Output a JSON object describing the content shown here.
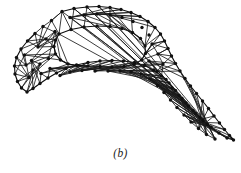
{
  "figure": {
    "caption": "(b)",
    "kind": "finite-element-mesh",
    "node_color": "#111111",
    "edge_color": "#1a1a1a",
    "background_color": "#ffffff",
    "node_radius": 1.7,
    "viewbox": "0 0 241 173"
  },
  "chart_data": {
    "type": "diagram",
    "subtitle": "(b)",
    "xlabel": "",
    "ylabel": "",
    "node_count": 96,
    "edge_count": 243,
    "outer_boundary_node_count": 58,
    "hole_boundary_node_count": 24,
    "nodes": [
      [
        62.0,
        11.5
      ],
      [
        74.0,
        8.5
      ],
      [
        87.0,
        7.0
      ],
      [
        99.0,
        6.5
      ],
      [
        110.0,
        7.5
      ],
      [
        121.0,
        9.5
      ],
      [
        131.0,
        12.5
      ],
      [
        140.0,
        16.5
      ],
      [
        148.0,
        21.5
      ],
      [
        155.0,
        27.5
      ],
      [
        160.5,
        34.0
      ],
      [
        164.5,
        41.0
      ],
      [
        168.0,
        48.5
      ],
      [
        171.5,
        56.0
      ],
      [
        175.5,
        63.5
      ],
      [
        180.0,
        71.0
      ],
      [
        185.0,
        78.5
      ],
      [
        190.5,
        86.0
      ],
      [
        196.5,
        93.5
      ],
      [
        202.5,
        101.0
      ],
      [
        208.5,
        108.5
      ],
      [
        214.0,
        116.0
      ],
      [
        219.5,
        123.0
      ],
      [
        224.5,
        129.5
      ],
      [
        229.5,
        135.5
      ],
      [
        233.5,
        140.0
      ],
      [
        227.0,
        138.0
      ],
      [
        219.0,
        133.0
      ],
      [
        211.0,
        127.0
      ],
      [
        203.0,
        120.5
      ],
      [
        195.5,
        113.5
      ],
      [
        188.5,
        106.0
      ],
      [
        182.0,
        98.5
      ],
      [
        175.5,
        90.5
      ],
      [
        169.0,
        83.0
      ],
      [
        161.5,
        76.0
      ],
      [
        153.5,
        70.0
      ],
      [
        144.5,
        65.5
      ],
      [
        134.5,
        62.5
      ],
      [
        123.5,
        61.0
      ],
      [
        112.0,
        60.5
      ],
      [
        100.0,
        61.0
      ],
      [
        88.0,
        62.5
      ],
      [
        76.5,
        65.0
      ],
      [
        66.0,
        68.5
      ],
      [
        56.5,
        73.0
      ],
      [
        48.0,
        78.0
      ],
      [
        40.0,
        83.5
      ],
      [
        33.0,
        88.5
      ],
      [
        27.0,
        92.0
      ],
      [
        21.5,
        88.0
      ],
      [
        17.5,
        81.5
      ],
      [
        15.0,
        74.0
      ],
      [
        14.5,
        66.0
      ],
      [
        16.5,
        57.5
      ],
      [
        21.0,
        49.0
      ],
      [
        27.5,
        41.0
      ],
      [
        35.0,
        33.5
      ],
      [
        43.0,
        26.5
      ],
      [
        51.5,
        20.5
      ],
      [
        59.0,
        34.0
      ],
      [
        71.0,
        29.5
      ],
      [
        84.0,
        27.0
      ],
      [
        97.0,
        26.0
      ],
      [
        110.0,
        26.5
      ],
      [
        122.0,
        28.5
      ],
      [
        132.5,
        32.5
      ],
      [
        140.5,
        38.5
      ],
      [
        145.0,
        46.0
      ],
      [
        145.5,
        53.5
      ],
      [
        141.5,
        60.0
      ],
      [
        134.0,
        64.5
      ],
      [
        124.0,
        66.5
      ],
      [
        112.0,
        67.0
      ],
      [
        100.0,
        66.5
      ],
      [
        88.0,
        66.0
      ],
      [
        77.0,
        65.5
      ],
      [
        68.0,
        64.0
      ],
      [
        60.5,
        60.0
      ],
      [
        55.5,
        54.0
      ],
      [
        54.0,
        46.5
      ],
      [
        55.5,
        40.0
      ],
      [
        38.0,
        47.0
      ],
      [
        46.0,
        39.0
      ],
      [
        55.0,
        31.5
      ],
      [
        48.5,
        58.5
      ],
      [
        40.0,
        64.0
      ],
      [
        33.0,
        70.0
      ],
      [
        29.0,
        77.5
      ],
      [
        26.0,
        65.0
      ],
      [
        24.5,
        55.0
      ],
      [
        31.5,
        60.5
      ],
      [
        41.0,
        73.5
      ],
      [
        50.0,
        68.5
      ],
      [
        60.0,
        75.5
      ],
      [
        70.0,
        72.0
      ],
      [
        82.0,
        70.5
      ],
      [
        95.0,
        71.0
      ],
      [
        108.0,
        71.0
      ],
      [
        120.0,
        71.0
      ],
      [
        131.0,
        71.5
      ],
      [
        141.0,
        74.0
      ],
      [
        150.0,
        79.0
      ],
      [
        157.5,
        85.5
      ],
      [
        164.0,
        92.5
      ],
      [
        170.5,
        100.0
      ],
      [
        177.0,
        107.5
      ],
      [
        184.0,
        115.0
      ],
      [
        191.0,
        122.0
      ],
      [
        198.5,
        128.5
      ],
      [
        206.5,
        134.5
      ],
      [
        215.0,
        139.0
      ],
      [
        152.0,
        44.0
      ],
      [
        158.0,
        54.0
      ],
      [
        163.0,
        64.0
      ],
      [
        157.0,
        71.5
      ],
      [
        149.0,
        61.0
      ],
      [
        166.0,
        79.5
      ],
      [
        172.0,
        88.0
      ],
      [
        179.0,
        95.5
      ],
      [
        186.0,
        103.0
      ],
      [
        193.0,
        110.5
      ],
      [
        200.0,
        117.5
      ],
      [
        207.5,
        124.5
      ],
      [
        70.0,
        17.5
      ],
      [
        84.0,
        15.0
      ],
      [
        97.0,
        14.0
      ],
      [
        110.0,
        15.0
      ],
      [
        122.0,
        17.5
      ],
      [
        133.0,
        21.5
      ],
      [
        142.0,
        27.5
      ],
      [
        149.0,
        35.0
      ]
    ],
    "edges": [
      [
        0,
        1
      ],
      [
        1,
        2
      ],
      [
        2,
        3
      ],
      [
        3,
        4
      ],
      [
        4,
        5
      ],
      [
        5,
        6
      ],
      [
        6,
        7
      ],
      [
        7,
        8
      ],
      [
        8,
        9
      ],
      [
        9,
        10
      ],
      [
        10,
        11
      ],
      [
        11,
        12
      ],
      [
        12,
        13
      ],
      [
        13,
        14
      ],
      [
        14,
        15
      ],
      [
        15,
        16
      ],
      [
        16,
        17
      ],
      [
        17,
        18
      ],
      [
        18,
        19
      ],
      [
        19,
        20
      ],
      [
        20,
        21
      ],
      [
        21,
        22
      ],
      [
        22,
        23
      ],
      [
        23,
        24
      ],
      [
        24,
        25
      ],
      [
        25,
        26
      ],
      [
        26,
        27
      ],
      [
        27,
        28
      ],
      [
        28,
        29
      ],
      [
        29,
        30
      ],
      [
        30,
        31
      ],
      [
        31,
        32
      ],
      [
        32,
        33
      ],
      [
        33,
        34
      ],
      [
        34,
        35
      ],
      [
        35,
        36
      ],
      [
        36,
        37
      ],
      [
        37,
        38
      ],
      [
        38,
        39
      ],
      [
        39,
        40
      ],
      [
        40,
        41
      ],
      [
        41,
        42
      ],
      [
        42,
        43
      ],
      [
        43,
        44
      ],
      [
        44,
        45
      ],
      [
        45,
        46
      ],
      [
        46,
        47
      ],
      [
        47,
        48
      ],
      [
        48,
        49
      ],
      [
        49,
        50
      ],
      [
        50,
        51
      ],
      [
        51,
        52
      ],
      [
        52,
        53
      ],
      [
        53,
        54
      ],
      [
        54,
        55
      ],
      [
        55,
        56
      ],
      [
        56,
        57
      ],
      [
        57,
        58
      ],
      [
        58,
        59
      ],
      [
        59,
        0
      ],
      [
        60,
        61
      ],
      [
        61,
        62
      ],
      [
        62,
        63
      ],
      [
        63,
        64
      ],
      [
        64,
        65
      ],
      [
        65,
        66
      ],
      [
        66,
        67
      ],
      [
        67,
        68
      ],
      [
        68,
        69
      ],
      [
        69,
        70
      ],
      [
        70,
        71
      ],
      [
        71,
        72
      ],
      [
        72,
        73
      ],
      [
        73,
        74
      ],
      [
        74,
        75
      ],
      [
        75,
        76
      ],
      [
        76,
        77
      ],
      [
        77,
        78
      ],
      [
        78,
        79
      ],
      [
        79,
        80
      ],
      [
        80,
        81
      ],
      [
        81,
        60
      ],
      [
        120,
        121
      ],
      [
        121,
        122
      ],
      [
        122,
        123
      ],
      [
        123,
        124
      ],
      [
        124,
        125
      ],
      [
        125,
        126
      ],
      [
        126,
        127
      ],
      [
        0,
        120
      ],
      [
        1,
        120
      ],
      [
        1,
        121
      ],
      [
        2,
        121
      ],
      [
        2,
        122
      ],
      [
        3,
        122
      ],
      [
        3,
        123
      ],
      [
        4,
        123
      ],
      [
        4,
        124
      ],
      [
        5,
        124
      ],
      [
        5,
        125
      ],
      [
        6,
        125
      ],
      [
        6,
        126
      ],
      [
        7,
        126
      ],
      [
        7,
        127
      ],
      [
        8,
        127
      ],
      [
        9,
        127
      ],
      [
        120,
        61
      ],
      [
        120,
        60
      ],
      [
        121,
        62
      ],
      [
        122,
        63
      ],
      [
        123,
        63
      ],
      [
        123,
        64
      ],
      [
        124,
        64
      ],
      [
        125,
        65
      ],
      [
        126,
        66
      ],
      [
        127,
        67
      ],
      [
        127,
        68
      ],
      [
        9,
        68
      ],
      [
        10,
        68
      ],
      [
        10,
        69
      ],
      [
        11,
        69
      ],
      [
        11,
        112
      ],
      [
        112,
        69
      ],
      [
        112,
        70
      ],
      [
        112,
        11
      ],
      [
        112,
        113
      ],
      [
        113,
        70
      ],
      [
        113,
        12
      ],
      [
        113,
        12
      ],
      [
        12,
        112
      ],
      [
        113,
        114
      ],
      [
        114,
        13
      ],
      [
        114,
        71
      ],
      [
        114,
        115
      ],
      [
        115,
        116
      ],
      [
        116,
        14
      ],
      [
        116,
        15
      ],
      [
        59,
        0
      ],
      [
        59,
        60
      ],
      [
        58,
        60
      ],
      [
        58,
        82
      ],
      [
        57,
        82
      ],
      [
        57,
        83
      ],
      [
        56,
        83
      ],
      [
        55,
        83
      ],
      [
        82,
        60
      ],
      [
        82,
        81
      ],
      [
        82,
        80
      ],
      [
        83,
        81
      ],
      [
        83,
        80
      ],
      [
        55,
        89
      ],
      [
        54,
        89
      ],
      [
        89,
        80
      ],
      [
        89,
        79
      ],
      [
        53,
        89
      ],
      [
        53,
        88
      ],
      [
        52,
        88
      ],
      [
        88,
        79
      ],
      [
        88,
        90
      ],
      [
        90,
        79
      ],
      [
        90,
        78
      ],
      [
        51,
        88
      ],
      [
        51,
        87
      ],
      [
        50,
        87
      ],
      [
        49,
        87
      ],
      [
        87,
        86
      ],
      [
        86,
        85
      ],
      [
        85,
        84
      ],
      [
        84,
        78
      ],
      [
        84,
        77
      ],
      [
        90,
        84
      ],
      [
        86,
        91
      ],
      [
        91,
        84
      ],
      [
        91,
        92
      ],
      [
        92,
        77
      ],
      [
        92,
        76
      ],
      [
        48,
        86
      ],
      [
        48,
        91
      ],
      [
        47,
        91
      ],
      [
        47,
        92
      ],
      [
        46,
        92
      ],
      [
        46,
        93
      ],
      [
        45,
        93
      ],
      [
        93,
        76
      ],
      [
        93,
        75
      ],
      [
        44,
        93
      ],
      [
        44,
        94
      ],
      [
        43,
        94
      ],
      [
        94,
        75
      ],
      [
        94,
        74
      ],
      [
        42,
        94
      ],
      [
        42,
        95
      ],
      [
        41,
        95
      ],
      [
        95,
        74
      ],
      [
        95,
        73
      ],
      [
        40,
        95
      ],
      [
        40,
        96
      ],
      [
        39,
        96
      ],
      [
        96,
        73
      ],
      [
        96,
        72
      ],
      [
        38,
        96
      ],
      [
        38,
        97
      ],
      [
        37,
        97
      ],
      [
        97,
        72
      ],
      [
        97,
        71
      ],
      [
        36,
        97
      ],
      [
        36,
        98
      ],
      [
        35,
        98
      ],
      [
        98,
        71
      ],
      [
        98,
        114
      ],
      [
        35,
        114
      ],
      [
        34,
        98
      ],
      [
        34,
        99
      ],
      [
        99,
        115
      ],
      [
        115,
        36
      ],
      [
        99,
        35
      ],
      [
        33,
        99
      ],
      [
        33,
        100
      ],
      [
        100,
        116
      ],
      [
        116,
        117
      ],
      [
        117,
        100
      ],
      [
        32,
        100
      ],
      [
        32,
        101
      ],
      [
        101,
        117
      ],
      [
        117,
        118
      ],
      [
        118,
        101
      ],
      [
        31,
        101
      ],
      [
        31,
        102
      ],
      [
        102,
        118
      ],
      [
        118,
        119
      ],
      [
        119,
        102
      ],
      [
        30,
        102
      ],
      [
        30,
        103
      ],
      [
        103,
        119
      ],
      [
        29,
        103
      ],
      [
        29,
        104
      ],
      [
        104,
        119
      ],
      [
        28,
        104
      ],
      [
        28,
        105
      ],
      [
        105,
        104
      ],
      [
        27,
        105
      ],
      [
        27,
        106
      ],
      [
        106,
        105
      ],
      [
        26,
        106
      ],
      [
        26,
        107
      ],
      [
        107,
        106
      ],
      [
        25,
        107
      ],
      [
        25,
        24
      ],
      [
        24,
        107
      ],
      [
        23,
        107
      ],
      [
        23,
        108
      ],
      [
        108,
        107
      ],
      [
        22,
        108
      ],
      [
        21,
        108
      ],
      [
        21,
        109
      ],
      [
        109,
        108
      ],
      [
        20,
        109
      ],
      [
        19,
        109
      ],
      [
        19,
        110
      ],
      [
        110,
        109
      ],
      [
        18,
        110
      ],
      [
        17,
        110
      ],
      [
        17,
        111
      ],
      [
        111,
        110
      ],
      [
        16,
        111
      ],
      [
        15,
        111
      ],
      [
        111,
        119
      ],
      [
        110,
        119
      ],
      [
        109,
        119
      ],
      [
        108,
        119
      ],
      [
        16,
        116
      ],
      [
        15,
        115
      ],
      [
        14,
        115
      ],
      [
        14,
        113
      ],
      [
        13,
        113
      ],
      [
        119,
        103
      ],
      [
        103,
        104
      ],
      [
        80,
        81
      ],
      [
        79,
        80
      ],
      [
        78,
        79
      ],
      [
        77,
        78
      ],
      [
        76,
        77
      ],
      [
        75,
        76
      ],
      [
        60,
        0
      ],
      [
        61,
        0
      ],
      [
        61,
        1
      ],
      [
        62,
        2
      ],
      [
        64,
        4
      ],
      [
        66,
        6
      ],
      [
        68,
        8
      ],
      [
        49,
        86
      ],
      [
        50,
        86
      ],
      [
        52,
        90
      ],
      [
        54,
        88
      ],
      [
        56,
        82
      ],
      [
        59,
        82
      ]
    ]
  }
}
